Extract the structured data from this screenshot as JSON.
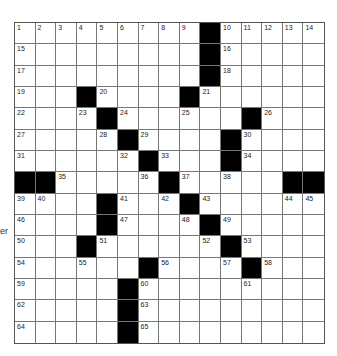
{
  "margin_text": "er",
  "puzzle": {
    "rows": 15,
    "cols": 15,
    "black_cells": [
      [
        0,
        9
      ],
      [
        1,
        9
      ],
      [
        2,
        9
      ],
      [
        3,
        3
      ],
      [
        3,
        8
      ],
      [
        4,
        4
      ],
      [
        4,
        11
      ],
      [
        5,
        5
      ],
      [
        5,
        10
      ],
      [
        6,
        6
      ],
      [
        6,
        10
      ],
      [
        7,
        0
      ],
      [
        7,
        1
      ],
      [
        7,
        7
      ],
      [
        7,
        13
      ],
      [
        7,
        14
      ],
      [
        8,
        4
      ],
      [
        8,
        8
      ],
      [
        9,
        4
      ],
      [
        9,
        9
      ],
      [
        10,
        3
      ],
      [
        10,
        10
      ],
      [
        11,
        6
      ],
      [
        11,
        11
      ],
      [
        12,
        5
      ],
      [
        13,
        5
      ],
      [
        14,
        5
      ]
    ],
    "numbers": [
      [
        0,
        0,
        1
      ],
      [
        0,
        1,
        2
      ],
      [
        0,
        2,
        3
      ],
      [
        0,
        3,
        4
      ],
      [
        0,
        4,
        5
      ],
      [
        0,
        5,
        6
      ],
      [
        0,
        6,
        7
      ],
      [
        0,
        7,
        8
      ],
      [
        0,
        8,
        9
      ],
      [
        0,
        10,
        10
      ],
      [
        0,
        11,
        11
      ],
      [
        0,
        12,
        12
      ],
      [
        0,
        13,
        13
      ],
      [
        0,
        14,
        14
      ],
      [
        1,
        0,
        15
      ],
      [
        1,
        10,
        16
      ],
      [
        2,
        0,
        17
      ],
      [
        2,
        10,
        18
      ],
      [
        3,
        0,
        19
      ],
      [
        3,
        4,
        20
      ],
      [
        3,
        9,
        21
      ],
      [
        4,
        0,
        22
      ],
      [
        4,
        3,
        23
      ],
      [
        4,
        5,
        24
      ],
      [
        4,
        8,
        25
      ],
      [
        4,
        12,
        26
      ],
      [
        5,
        0,
        27
      ],
      [
        5,
        4,
        28
      ],
      [
        5,
        6,
        29
      ],
      [
        5,
        11,
        30
      ],
      [
        6,
        0,
        31
      ],
      [
        6,
        5,
        32
      ],
      [
        6,
        7,
        33
      ],
      [
        6,
        11,
        34
      ],
      [
        7,
        2,
        35
      ],
      [
        7,
        6,
        36
      ],
      [
        7,
        8,
        37
      ],
      [
        7,
        10,
        38
      ],
      [
        8,
        0,
        39
      ],
      [
        8,
        1,
        40
      ],
      [
        8,
        5,
        41
      ],
      [
        8,
        7,
        42
      ],
      [
        8,
        9,
        43
      ],
      [
        8,
        13,
        44
      ],
      [
        8,
        14,
        45
      ],
      [
        9,
        0,
        46
      ],
      [
        9,
        5,
        47
      ],
      [
        9,
        8,
        48
      ],
      [
        9,
        10,
        49
      ],
      [
        10,
        0,
        50
      ],
      [
        10,
        4,
        51
      ],
      [
        10,
        9,
        52
      ],
      [
        10,
        11,
        53
      ],
      [
        11,
        0,
        54
      ],
      [
        11,
        3,
        55
      ],
      [
        11,
        7,
        56
      ],
      [
        11,
        10,
        57
      ],
      [
        11,
        12,
        58
      ],
      [
        12,
        0,
        59
      ],
      [
        12,
        6,
        60
      ],
      [
        12,
        11,
        61
      ],
      [
        13,
        0,
        62
      ],
      [
        13,
        6,
        63
      ],
      [
        14,
        0,
        64
      ],
      [
        14,
        6,
        65
      ]
    ]
  }
}
